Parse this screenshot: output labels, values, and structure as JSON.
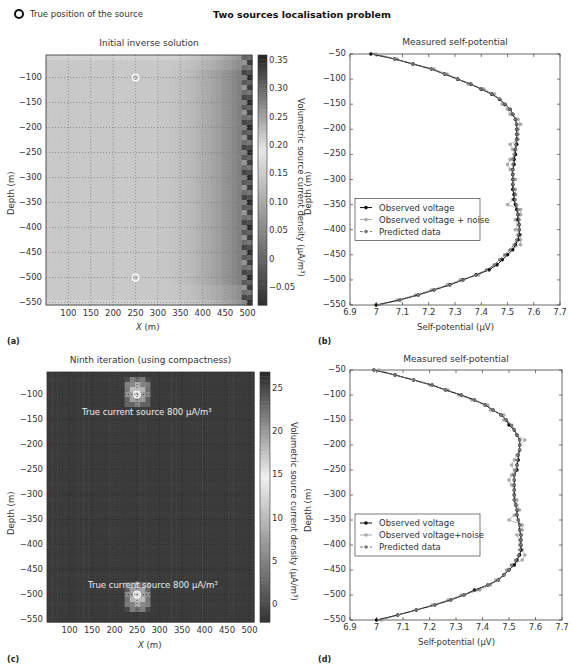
{
  "header": {
    "legend_marker": "open-circle",
    "legend_text": "True position of the source",
    "main_title": "Two sources localisation problem"
  },
  "panels": {
    "a": {
      "label": "(a)",
      "title": "Initial inverse solution",
      "xlabel": "X (m)",
      "ylabel": "Depth (m)",
      "colorbar_label": "Volumetric source current density (μA/m³)",
      "xticks": [
        "100",
        "150",
        "200",
        "250",
        "300",
        "350",
        "400",
        "450",
        "500"
      ],
      "yticks": [
        "-100",
        "-150",
        "-200",
        "-250",
        "-300",
        "-350",
        "-400",
        "-450",
        "-500",
        "-550"
      ],
      "cbar_ticks": [
        "0.35",
        "0.30",
        "0.25",
        "0.20",
        "0.15",
        "0.10",
        "0.05",
        "0",
        "-0.05"
      ]
    },
    "b": {
      "label": "(b)",
      "title": "Measured self-potential",
      "xlabel": "Self-potential (μV)",
      "ylabel": "Depth (m)",
      "xticks": [
        "6.9",
        "7",
        "7.1",
        "7.2",
        "7.3",
        "7.4",
        "7.5",
        "7.6",
        "7.7"
      ],
      "yticks": [
        "-50",
        "-100",
        "-150",
        "-200",
        "-250",
        "-300",
        "-350",
        "-400",
        "-450",
        "-500",
        "-550"
      ],
      "legend": [
        "Observed voltage",
        "Observed voltage + noise",
        "Predicted data"
      ]
    },
    "c": {
      "label": "(c)",
      "title": "Ninth iteration (using compactness)",
      "xlabel": "X (m)",
      "ylabel": "Depth (m)",
      "colorbar_label": "Volumetric source current density (μA/m³)",
      "annotation_top": "True current source 800 μA/m³",
      "annotation_bottom": "True current source 800 μA/m³",
      "xticks": [
        "100",
        "150",
        "200",
        "250",
        "300",
        "350",
        "400",
        "450",
        "500"
      ],
      "yticks": [
        "-100",
        "-150",
        "-200",
        "-250",
        "-300",
        "-350",
        "-400",
        "-450",
        "-500",
        "-550"
      ],
      "cbar_ticks": [
        "25",
        "20",
        "15",
        "10",
        "5",
        "0"
      ]
    },
    "d": {
      "label": "(d)",
      "title": "Measured self-potential",
      "xlabel": "Self-potential (μV)",
      "ylabel": "Depth (m)",
      "xticks": [
        "6.9",
        "7",
        "7.1",
        "7.2",
        "7.3",
        "7.4",
        "7.5",
        "7.6",
        "7.7"
      ],
      "yticks": [
        "-50",
        "-100",
        "-150",
        "-200",
        "-250",
        "-300",
        "-350",
        "-400",
        "-450",
        "-500",
        "-550"
      ],
      "legend": [
        "Observed voltage",
        "Observed voltage+noise",
        "Predicted data"
      ]
    }
  },
  "chart_data": [
    {
      "type": "heatmap",
      "title": "Initial inverse solution",
      "xlabel": "X (m)",
      "ylabel": "Depth (m)",
      "xlim": [
        50,
        510
      ],
      "ylim": [
        -555,
        -55
      ],
      "colorbar": {
        "label": "Volumetric source current density (μA/m³)",
        "range": [
          -0.08,
          0.36
        ]
      },
      "sources": [
        {
          "x": 250,
          "y": -100
        },
        {
          "x": 250,
          "y": -500
        }
      ],
      "description": "Smooth light-grey field (~0.17-0.2) darkening toward x=450-500 (values up to ~0.35 at right edge)"
    },
    {
      "type": "line",
      "title": "Measured self-potential",
      "xlabel": "Self-potential (μV)",
      "ylabel": "Depth (m)",
      "xlim": [
        6.9,
        7.7
      ],
      "ylim": [
        -550,
        -50
      ],
      "legend_position": "center-left",
      "y": [
        -50,
        -60,
        -70,
        -80,
        -90,
        -100,
        -110,
        -120,
        -130,
        -140,
        -150,
        -160,
        -170,
        -180,
        -190,
        -200,
        -210,
        -220,
        -230,
        -240,
        -250,
        -260,
        -270,
        -280,
        -290,
        -300,
        -310,
        -320,
        -330,
        -340,
        -350,
        -360,
        -370,
        -380,
        -390,
        -400,
        -410,
        -420,
        -430,
        -440,
        -450,
        -460,
        -470,
        -480,
        -490,
        -500,
        -510,
        -520,
        -530,
        -540,
        -550
      ],
      "series": [
        {
          "name": "Observed voltage",
          "values": [
            6.98,
            7.07,
            7.14,
            7.21,
            7.26,
            7.31,
            7.36,
            7.4,
            7.44,
            7.47,
            7.49,
            7.51,
            7.52,
            7.53,
            7.535,
            7.535,
            7.535,
            7.535,
            7.535,
            7.53,
            7.53,
            7.525,
            7.525,
            7.52,
            7.52,
            7.52,
            7.52,
            7.52,
            7.525,
            7.525,
            7.53,
            7.535,
            7.54,
            7.54,
            7.545,
            7.545,
            7.545,
            7.54,
            7.53,
            7.52,
            7.5,
            7.48,
            7.46,
            7.43,
            7.38,
            7.33,
            7.28,
            7.22,
            7.16,
            7.09,
            7.0
          ]
        },
        {
          "name": "Observed voltage + noise",
          "values": [
            7.0,
            7.08,
            7.14,
            7.22,
            7.27,
            7.31,
            7.35,
            7.41,
            7.45,
            7.47,
            7.48,
            7.5,
            7.51,
            7.54,
            7.55,
            7.54,
            7.54,
            7.54,
            7.51,
            7.52,
            7.53,
            7.51,
            7.5,
            7.51,
            7.52,
            7.53,
            7.52,
            7.53,
            7.53,
            7.52,
            7.5,
            7.55,
            7.55,
            7.53,
            7.54,
            7.53,
            7.55,
            7.55,
            7.55,
            7.51,
            7.49,
            7.47,
            7.45,
            7.42,
            7.39,
            7.32,
            7.27,
            7.21,
            7.15,
            7.08,
            7.0
          ]
        },
        {
          "name": "Predicted data",
          "values": [
            6.99,
            7.07,
            7.14,
            7.21,
            7.26,
            7.31,
            7.36,
            7.4,
            7.44,
            7.47,
            7.49,
            7.51,
            7.52,
            7.53,
            7.535,
            7.535,
            7.535,
            7.535,
            7.53,
            7.53,
            7.525,
            7.52,
            7.52,
            7.52,
            7.52,
            7.52,
            7.52,
            7.525,
            7.53,
            7.53,
            7.535,
            7.54,
            7.54,
            7.545,
            7.545,
            7.545,
            7.54,
            7.535,
            7.525,
            7.51,
            7.49,
            7.47,
            7.45,
            7.42,
            7.38,
            7.33,
            7.28,
            7.22,
            7.16,
            7.09,
            7.01
          ]
        }
      ]
    },
    {
      "type": "heatmap",
      "title": "Ninth iteration (using compactness)",
      "xlabel": "X (m)",
      "ylabel": "Depth (m)",
      "xlim": [
        50,
        510
      ],
      "ylim": [
        -555,
        -55
      ],
      "colorbar": {
        "label": "Volumetric source current density (μA/m³)",
        "range": [
          -2,
          27
        ]
      },
      "annotations": [
        "True current source 800 μA/m³ (near x=250, y=-100)",
        "True current source 800 μA/m³ (near x=250, y=-500)"
      ],
      "sources": [
        {
          "x": 250,
          "y": -100
        },
        {
          "x": 250,
          "y": -500
        }
      ],
      "description": "Near-zero dark background with two compact bright blobs at the true source positions"
    },
    {
      "type": "line",
      "title": "Measured self-potential",
      "xlabel": "Self-potential (μV)",
      "ylabel": "Depth (m)",
      "xlim": [
        6.9,
        7.7
      ],
      "ylim": [
        -550,
        -50
      ],
      "legend_position": "center-left",
      "y": [
        -50,
        -60,
        -70,
        -80,
        -90,
        -100,
        -110,
        -120,
        -130,
        -140,
        -150,
        -160,
        -170,
        -180,
        -190,
        -200,
        -210,
        -220,
        -230,
        -240,
        -250,
        -260,
        -270,
        -280,
        -290,
        -300,
        -310,
        -320,
        -330,
        -340,
        -350,
        -360,
        -370,
        -380,
        -390,
        -400,
        -410,
        -420,
        -430,
        -440,
        -450,
        -460,
        -470,
        -480,
        -490,
        -500,
        -510,
        -520,
        -530,
        -540,
        -550
      ],
      "series": [
        {
          "name": "Observed voltage",
          "values": [
            6.99,
            7.07,
            7.14,
            7.21,
            7.26,
            7.32,
            7.37,
            7.41,
            7.44,
            7.47,
            7.49,
            7.5,
            7.52,
            7.53,
            7.54,
            7.54,
            7.54,
            7.535,
            7.535,
            7.53,
            7.53,
            7.52,
            7.52,
            7.52,
            7.52,
            7.52,
            7.52,
            7.525,
            7.53,
            7.53,
            7.535,
            7.54,
            7.54,
            7.545,
            7.545,
            7.545,
            7.545,
            7.54,
            7.53,
            7.52,
            7.5,
            7.48,
            7.46,
            7.42,
            7.37,
            7.33,
            7.28,
            7.22,
            7.15,
            7.08,
            7.0
          ]
        },
        {
          "name": "Observed voltage+noise",
          "values": [
            7.01,
            7.07,
            7.14,
            7.2,
            7.27,
            7.31,
            7.36,
            7.42,
            7.43,
            7.48,
            7.48,
            7.51,
            7.52,
            7.53,
            7.56,
            7.54,
            7.54,
            7.53,
            7.52,
            7.51,
            7.52,
            7.51,
            7.5,
            7.51,
            7.52,
            7.52,
            7.53,
            7.53,
            7.54,
            7.52,
            7.5,
            7.55,
            7.55,
            7.53,
            7.54,
            7.54,
            7.55,
            7.56,
            7.55,
            7.51,
            7.49,
            7.48,
            7.45,
            7.43,
            7.39,
            7.32,
            7.27,
            7.21,
            7.15,
            7.08,
            7.02
          ]
        },
        {
          "name": "Predicted data",
          "values": [
            6.99,
            7.07,
            7.14,
            7.21,
            7.26,
            7.32,
            7.37,
            7.41,
            7.44,
            7.47,
            7.49,
            7.51,
            7.52,
            7.53,
            7.54,
            7.54,
            7.54,
            7.535,
            7.53,
            7.53,
            7.525,
            7.52,
            7.52,
            7.52,
            7.52,
            7.52,
            7.52,
            7.525,
            7.53,
            7.53,
            7.535,
            7.54,
            7.54,
            7.545,
            7.545,
            7.545,
            7.54,
            7.535,
            7.525,
            7.51,
            7.5,
            7.48,
            7.46,
            7.42,
            7.38,
            7.33,
            7.28,
            7.22,
            7.15,
            7.08,
            7.01
          ]
        }
      ]
    }
  ]
}
